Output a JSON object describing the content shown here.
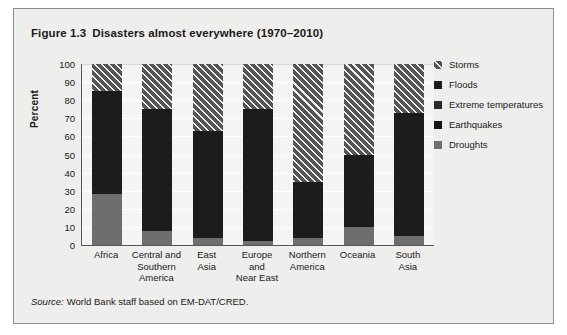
{
  "figure": {
    "number": "Figure 1.3",
    "title": "Disasters almost everywhere (1970–2010)",
    "source_word": "Source:",
    "source_text": "World Bank staff based on EM-DAT/CRED."
  },
  "colors": {
    "card_background": "#eeeeec",
    "plot_background": "#f4f4f2",
    "axis": "#555555",
    "storms": "#555555",
    "floods": "#1c1c1c",
    "extreme_temperatures": "#2a2a2a",
    "earthquakes": "#141414",
    "droughts": "#6e6e6e"
  },
  "chart_data": {
    "type": "bar",
    "stacked": true,
    "xlabel": "",
    "ylabel": "Percent",
    "ylim": [
      0,
      100
    ],
    "yticks": [
      100,
      90,
      80,
      70,
      60,
      50,
      40,
      30,
      20,
      10,
      0
    ],
    "grid": true,
    "legend_position": "right",
    "categories": [
      "Africa",
      "Central and Southern America",
      "East Asia",
      "Europe and Near East",
      "Northern America",
      "Oceania",
      "South Asia"
    ],
    "category_labels": [
      [
        "Africa"
      ],
      [
        "Central and",
        "Southern",
        "America"
      ],
      [
        "East",
        "Asia"
      ],
      [
        "Europe",
        "and",
        "Near East"
      ],
      [
        "Northern",
        "America"
      ],
      [
        "Oceania"
      ],
      [
        "South",
        "Asia"
      ]
    ],
    "series": [
      {
        "name": "Droughts",
        "key": "droughts",
        "fill": "fill-droughts",
        "values": [
          28,
          8,
          4,
          2,
          4,
          10,
          5
        ]
      },
      {
        "name": "Earthquakes",
        "key": "earthquakes",
        "fill": "fill-quakes",
        "values": [
          0,
          0,
          0,
          0,
          0,
          0,
          0
        ]
      },
      {
        "name": "Extreme temperatures",
        "key": "extreme",
        "fill": "fill-extreme",
        "values": [
          0,
          0,
          0,
          0,
          0,
          0,
          0
        ]
      },
      {
        "name": "Floods",
        "key": "floods",
        "fill": "fill-floods",
        "values": [
          57,
          67,
          59,
          73,
          31,
          40,
          68
        ]
      },
      {
        "name": "Storms",
        "key": "storms",
        "fill": "fill-storms",
        "values": [
          15,
          25,
          37,
          25,
          65,
          50,
          27
        ]
      }
    ]
  },
  "legend": {
    "items": [
      {
        "label": "Storms",
        "fill": "fill-storms"
      },
      {
        "label": "Floods",
        "fill": "fill-floods"
      },
      {
        "label": "Extreme temperatures",
        "fill": "fill-extreme"
      },
      {
        "label": "Earthquakes",
        "fill": "fill-quakes"
      },
      {
        "label": "Droughts",
        "fill": "fill-droughts"
      }
    ]
  }
}
